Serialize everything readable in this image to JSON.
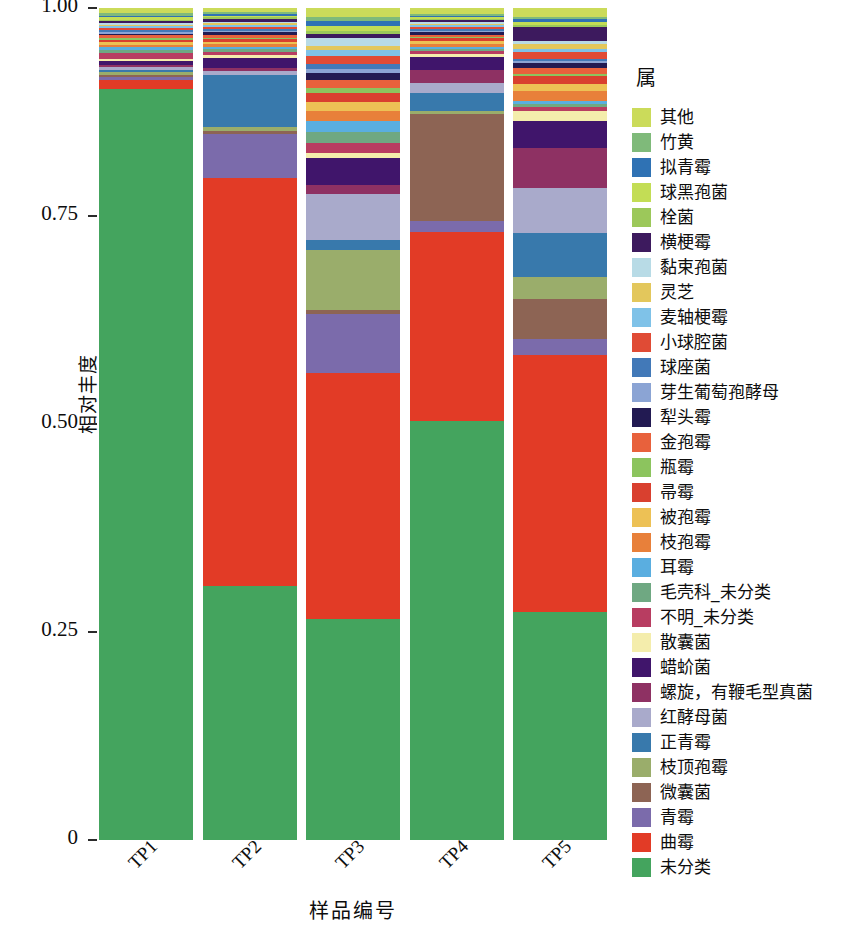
{
  "chart_data": {
    "type": "bar",
    "stacked": true,
    "normalized": true,
    "title": "",
    "xlabel": "样品编号",
    "ylabel": "相对丰度",
    "legend_title": "属",
    "legend_position": "right",
    "grid": false,
    "ylim": [
      0,
      1
    ],
    "ytick_labels": [
      "1.00",
      "0.75",
      "0.50",
      "0.25",
      "0"
    ],
    "ytick_values": [
      1.0,
      0.75,
      0.5,
      0.25,
      0
    ],
    "categories": [
      "TP1",
      "TP2",
      "TP3",
      "TP4",
      "TP5"
    ],
    "series": [
      {
        "name": "其他",
        "color": "#cbdb5a",
        "values": [
          0.006,
          0.005,
          0.012,
          0.008,
          0.012
        ]
      },
      {
        "name": "竹黄",
        "color": "#7fba7a",
        "values": [
          0.003,
          0.002,
          0.005,
          0.002,
          0.003
        ]
      },
      {
        "name": "拟青霉",
        "color": "#2f72b4",
        "values": [
          0.002,
          0.002,
          0.006,
          0.002,
          0.004
        ]
      },
      {
        "name": "球黑孢菌",
        "color": "#c3dd55",
        "values": [
          0.003,
          0.002,
          0.007,
          0.002,
          0.004
        ]
      },
      {
        "name": "栓菌",
        "color": "#9cc85a",
        "values": [
          0.002,
          0.002,
          0.004,
          0.002,
          0.003
        ]
      },
      {
        "name": "横梗霉",
        "color": "#3d1a5e",
        "values": [
          0.002,
          0.003,
          0.005,
          0.003,
          0.02
        ]
      },
      {
        "name": "黏束孢菌",
        "color": "#b8dbe6",
        "values": [
          0.002,
          0.002,
          0.01,
          0.002,
          0.003
        ]
      },
      {
        "name": "灵芝",
        "color": "#e3c75c",
        "values": [
          0.002,
          0.002,
          0.006,
          0.002,
          0.008
        ]
      },
      {
        "name": "麦轴梗霉",
        "color": "#7fc2e8",
        "values": [
          0.002,
          0.002,
          0.008,
          0.002,
          0.003
        ]
      },
      {
        "name": "小球腔菌",
        "color": "#e04b35",
        "values": [
          0.003,
          0.003,
          0.01,
          0.003,
          0.01
        ]
      },
      {
        "name": "球座菌",
        "color": "#4279b8",
        "values": [
          0.002,
          0.002,
          0.006,
          0.002,
          0.003
        ]
      },
      {
        "name": "芽生葡萄孢酵母",
        "color": "#8ba4d4",
        "values": [
          0.002,
          0.002,
          0.006,
          0.002,
          0.003
        ]
      },
      {
        "name": "犁头霉",
        "color": "#221a52",
        "values": [
          0.002,
          0.003,
          0.008,
          0.003,
          0.006
        ]
      },
      {
        "name": "金孢霉",
        "color": "#e8613c",
        "values": [
          0.003,
          0.003,
          0.011,
          0.003,
          0.009
        ]
      },
      {
        "name": "瓶霉",
        "color": "#8cc45e",
        "values": [
          0.002,
          0.002,
          0.006,
          0.002,
          0.003
        ]
      },
      {
        "name": "帚霉",
        "color": "#d9402f",
        "values": [
          0.003,
          0.003,
          0.012,
          0.003,
          0.01
        ]
      },
      {
        "name": "被孢霉",
        "color": "#edc155",
        "values": [
          0.003,
          0.003,
          0.012,
          0.004,
          0.01
        ]
      },
      {
        "name": "枝孢霉",
        "color": "#e8803a",
        "values": [
          0.003,
          0.003,
          0.013,
          0.004,
          0.014
        ]
      },
      {
        "name": "耳霉",
        "color": "#5aaee0",
        "values": [
          0.003,
          0.003,
          0.014,
          0.003,
          0.004
        ]
      },
      {
        "name": "毛壳科_未分类",
        "color": "#6fa882",
        "values": [
          0.004,
          0.003,
          0.015,
          0.003,
          0.004
        ]
      },
      {
        "name": "不明_未分类",
        "color": "#b83d61",
        "values": [
          0.007,
          0.004,
          0.013,
          0.004,
          0.006
        ]
      },
      {
        "name": "散囊菌",
        "color": "#f4edac",
        "values": [
          0.003,
          0.003,
          0.006,
          0.004,
          0.013
        ]
      },
      {
        "name": "蜡蚧菌",
        "color": "#40156b",
        "values": [
          0.004,
          0.012,
          0.035,
          0.016,
          0.038
        ]
      },
      {
        "name": "螺旋，有鞭毛型真菌",
        "color": "#8e3163",
        "values": [
          0.003,
          0.004,
          0.012,
          0.018,
          0.055
        ]
      },
      {
        "name": "红酵母菌",
        "color": "#a9aacb",
        "values": [
          0.003,
          0.004,
          0.06,
          0.013,
          0.062
        ]
      },
      {
        "name": "正青霉",
        "color": "#3879ac",
        "values": [
          0.003,
          0.062,
          0.013,
          0.023,
          0.06
        ]
      },
      {
        "name": "枝顶孢霉",
        "color": "#9aad6b",
        "values": [
          0.003,
          0.004,
          0.078,
          0.004,
          0.03
        ]
      },
      {
        "name": "微囊菌",
        "color": "#8d6454",
        "values": [
          0.003,
          0.004,
          0.005,
          0.14,
          0.055
        ]
      },
      {
        "name": "青霉",
        "color": "#7b6bab",
        "values": [
          0.004,
          0.052,
          0.077,
          0.015,
          0.022
        ]
      },
      {
        "name": "曲霉",
        "color": "#e23b26",
        "values": [
          0.01,
          0.481,
          0.319,
          0.247,
          0.353
        ]
      },
      {
        "name": "未分类",
        "color": "#44a45e",
        "values": [
          0.9,
          0.3,
          0.287,
          0.549,
          0.313
        ]
      }
    ]
  },
  "axes": {
    "y": {
      "title": "相对丰度",
      "ticks": [
        {
          "label": "1.00",
          "value": 1.0
        },
        {
          "label": "0.75",
          "value": 0.75
        },
        {
          "label": "0.50",
          "value": 0.5
        },
        {
          "label": "0.25",
          "value": 0.25
        },
        {
          "label": "0",
          "value": 0
        }
      ]
    },
    "x": {
      "title": "样品编号",
      "ticks": [
        "TP1",
        "TP2",
        "TP3",
        "TP4",
        "TP5"
      ]
    }
  },
  "legend": {
    "title": "属",
    "items": [
      {
        "label": "其他",
        "color": "#cbdb5a"
      },
      {
        "label": "竹黄",
        "color": "#7fba7a"
      },
      {
        "label": "拟青霉",
        "color": "#2f72b4"
      },
      {
        "label": "球黑孢菌",
        "color": "#c3dd55"
      },
      {
        "label": "栓菌",
        "color": "#9cc85a"
      },
      {
        "label": "横梗霉",
        "color": "#3d1a5e"
      },
      {
        "label": "黏束孢菌",
        "color": "#b8dbe6"
      },
      {
        "label": "灵芝",
        "color": "#e3c75c"
      },
      {
        "label": "麦轴梗霉",
        "color": "#7fc2e8"
      },
      {
        "label": "小球腔菌",
        "color": "#e04b35"
      },
      {
        "label": "球座菌",
        "color": "#4279b8"
      },
      {
        "label": "芽生葡萄孢酵母",
        "color": "#8ba4d4"
      },
      {
        "label": "犁头霉",
        "color": "#221a52"
      },
      {
        "label": "金孢霉",
        "color": "#e8613c"
      },
      {
        "label": "瓶霉",
        "color": "#8cc45e"
      },
      {
        "label": "帚霉",
        "color": "#d9402f"
      },
      {
        "label": "被孢霉",
        "color": "#edc155"
      },
      {
        "label": "枝孢霉",
        "color": "#e8803a"
      },
      {
        "label": "耳霉",
        "color": "#5aaee0"
      },
      {
        "label": "毛壳科_未分类",
        "color": "#6fa882"
      },
      {
        "label": "不明_未分类",
        "color": "#b83d61"
      },
      {
        "label": "散囊菌",
        "color": "#f4edac"
      },
      {
        "label": "蜡蚧菌",
        "color": "#40156b"
      },
      {
        "label": "螺旋，有鞭毛型真菌",
        "color": "#8e3163"
      },
      {
        "label": "红酵母菌",
        "color": "#a9aacb"
      },
      {
        "label": "正青霉",
        "color": "#3879ac"
      },
      {
        "label": "枝顶孢霉",
        "color": "#9aad6b"
      },
      {
        "label": "微囊菌",
        "color": "#8d6454"
      },
      {
        "label": "青霉",
        "color": "#7b6bab"
      },
      {
        "label": "曲霉",
        "color": "#e23b26"
      },
      {
        "label": "未分类",
        "color": "#44a45e"
      }
    ]
  }
}
